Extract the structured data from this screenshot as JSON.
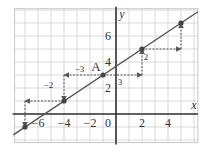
{
  "chart_data": {
    "type": "line",
    "title": "",
    "xlabel": "x",
    "ylabel": "y",
    "xlim": [
      -7.8,
      6.3
    ],
    "ylim": [
      -2.2,
      8.1
    ],
    "grid": true,
    "x_ticks": [
      -6,
      -4,
      -2,
      0,
      2,
      4
    ],
    "x_tick_labels": [
      "−6",
      "−4",
      "−2",
      "0",
      "2",
      "4"
    ],
    "y_ticks": [
      2,
      4,
      6
    ],
    "y_tick_labels": [
      "2",
      "4",
      "6"
    ],
    "line": {
      "slope": 0.6667,
      "intercept": 3.6667,
      "x_range": [
        -7.9,
        6.3
      ]
    },
    "points": [
      {
        "x": -7,
        "y": -1,
        "label": ""
      },
      {
        "x": -4,
        "y": 1,
        "label": ""
      },
      {
        "x": -1,
        "y": 3,
        "label": "A"
      },
      {
        "x": 2,
        "y": 5,
        "label": ""
      },
      {
        "x": 5,
        "y": 7,
        "label": ""
      }
    ],
    "steps": [
      {
        "from": [
          -1,
          3
        ],
        "run": 3,
        "rise": 2,
        "run_label": "3",
        "rise_label": "2"
      },
      {
        "from": [
          2,
          5
        ],
        "run": 3,
        "rise": 2,
        "run_label": "",
        "rise_label": ""
      },
      {
        "from": [
          -1,
          3
        ],
        "run": -3,
        "rise": -2,
        "run_label": "−3",
        "rise_label": "−2"
      },
      {
        "from": [
          -4,
          1
        ],
        "run": -3,
        "rise": -2,
        "run_label": "",
        "rise_label": ""
      }
    ],
    "annotations": [
      {
        "text": "A",
        "at": [
          -1,
          3
        ]
      },
      {
        "text": "3",
        "near": [
          0.3,
          2.5
        ]
      },
      {
        "text": "2",
        "near": [
          2.3,
          4.4
        ]
      },
      {
        "text": "−3",
        "near": [
          -2.8,
          3.5
        ]
      },
      {
        "text": "−2",
        "near": [
          -5.2,
          2.2
        ]
      }
    ]
  }
}
